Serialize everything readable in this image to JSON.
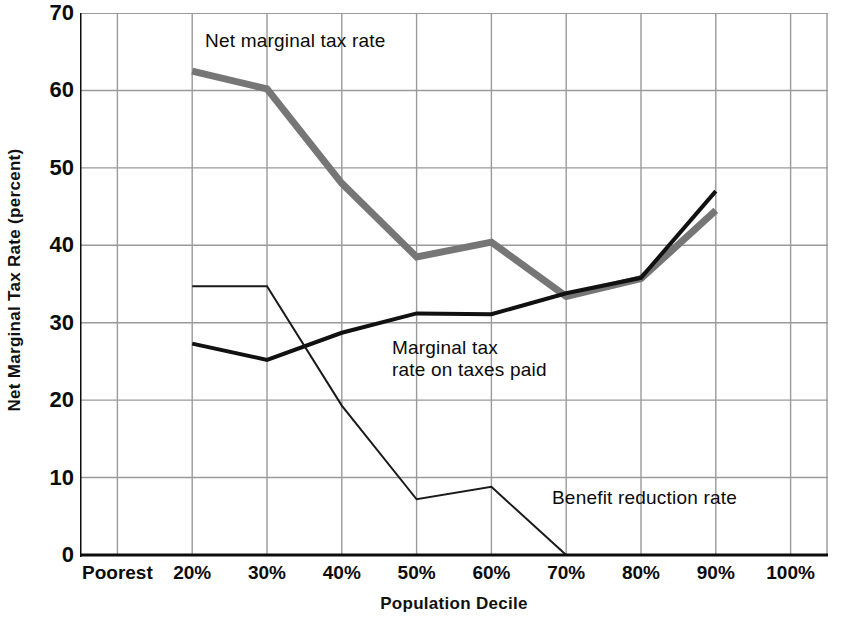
{
  "chart_data": {
    "type": "line",
    "title": "",
    "subtitle": "",
    "xlabel": "Population Decile",
    "ylabel": "Net Marginal Tax Rate (percent)",
    "categories": [
      "Poorest",
      "20%",
      "30%",
      "40%",
      "50%",
      "60%",
      "70%",
      "80%",
      "90%",
      "100%"
    ],
    "xlim": [
      0,
      9
    ],
    "ylim": [
      0,
      70
    ],
    "yticks": [
      0,
      10,
      20,
      30,
      40,
      50,
      60,
      70
    ],
    "ytick_labels": [
      "0",
      "10",
      "20",
      "30",
      "40",
      "50",
      "60",
      "70"
    ],
    "grid": "both axes, light gray solid gridlines",
    "legend": "inline annotations next to each curve",
    "series": [
      {
        "name": "Net marginal tax rate",
        "style": "thick gray line",
        "color": "#767676",
        "width_px": 7,
        "x": [
          "20%",
          "30%",
          "40%",
          "50%",
          "60%",
          "70%",
          "80%",
          "90%"
        ],
        "values": [
          62.5,
          60.2,
          48.0,
          38.5,
          40.4,
          33.4,
          35.7,
          44.5
        ]
      },
      {
        "name": "Marginal tax rate on taxes paid",
        "style": "medium black line",
        "color": "#111111",
        "width_px": 4,
        "x": [
          "20%",
          "30%",
          "40%",
          "50%",
          "60%",
          "70%",
          "80%",
          "90%"
        ],
        "values": [
          27.3,
          25.2,
          28.7,
          31.2,
          31.1,
          33.8,
          35.8,
          47.0
        ]
      },
      {
        "name": "Benefit reduction rate",
        "style": "thin black line",
        "color": "#1a1a1a",
        "width_px": 2,
        "x": [
          "20%",
          "30%",
          "40%",
          "50%",
          "60%",
          "70%",
          "80%",
          "90%"
        ],
        "values": [
          34.7,
          34.7,
          19.3,
          7.2,
          8.8,
          0.0,
          0.0,
          0.0
        ]
      }
    ],
    "annotations": [
      {
        "id": "net",
        "text": "Net marginal tax rate",
        "near_series": "Net marginal tax rate"
      },
      {
        "id": "marg",
        "text": "Marginal tax\nrate on taxes paid",
        "near_series": "Marginal tax rate on taxes paid"
      },
      {
        "id": "ben",
        "text": "Benefit reduction rate",
        "near_series": "Benefit reduction rate"
      }
    ]
  },
  "colors": {
    "background": "#ffffff",
    "axis": "#0c0c0c",
    "grid": "#9a9a9a",
    "series_net": "#767676",
    "series_marginal": "#111111",
    "series_benefit": "#1a1a1a",
    "text": "#0c0c0c"
  }
}
